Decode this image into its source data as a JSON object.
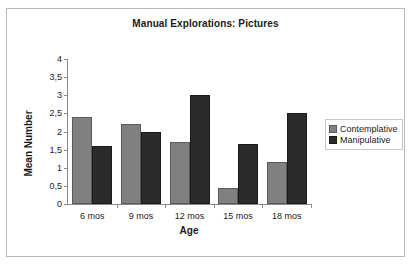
{
  "chart_data": {
    "type": "bar",
    "title": "Manual Explorations: Pictures",
    "xlabel": "Age",
    "ylabel": "Mean Number",
    "categories": [
      "6 mos",
      "9 mos",
      "12 mos",
      "15 mos",
      "18 mos"
    ],
    "series": [
      {
        "name": "Contemplative",
        "color": "#808080",
        "values": [
          2.4,
          2.2,
          1.7,
          0.45,
          1.15
        ]
      },
      {
        "name": "Manipulative",
        "color": "#2b2b2b",
        "values": [
          1.6,
          2.0,
          3.0,
          1.65,
          2.5
        ]
      }
    ],
    "ylim": [
      0,
      4
    ],
    "ytick_values": [
      0,
      0.5,
      1,
      1.5,
      2,
      2.5,
      3,
      3.5,
      4
    ],
    "ytick_labels": [
      "0",
      "0,5",
      "1",
      "1,5",
      "2",
      "2,5",
      "3",
      "3,5",
      "4"
    ],
    "grid": false,
    "legend_position": "right"
  }
}
